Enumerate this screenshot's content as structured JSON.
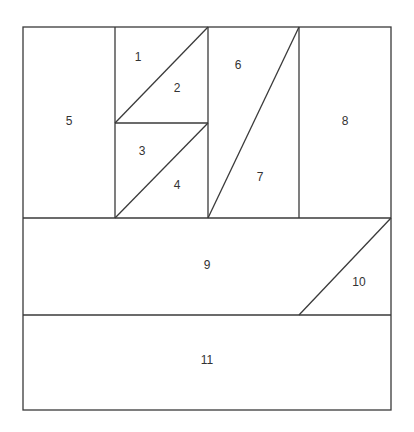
{
  "diagram": {
    "type": "quilt-block-piecing-diagram",
    "line_color": "#3a3a3a",
    "background": "#ffffff",
    "pieces": [
      {
        "id": "1",
        "label": "1",
        "x": 138,
        "y": 58
      },
      {
        "id": "2",
        "label": "2",
        "x": 177,
        "y": 89
      },
      {
        "id": "3",
        "label": "3",
        "x": 142,
        "y": 152
      },
      {
        "id": "4",
        "label": "4",
        "x": 177,
        "y": 186
      },
      {
        "id": "5",
        "label": "5",
        "x": 69,
        "y": 122
      },
      {
        "id": "6",
        "label": "6",
        "x": 238,
        "y": 66
      },
      {
        "id": "7",
        "label": "7",
        "x": 260,
        "y": 178
      },
      {
        "id": "8",
        "label": "8",
        "x": 345,
        "y": 122
      },
      {
        "id": "9",
        "label": "9",
        "x": 207,
        "y": 266
      },
      {
        "id": "10",
        "label": "10",
        "x": 359,
        "y": 283
      },
      {
        "id": "11",
        "label": "11",
        "x": 207,
        "y": 361
      }
    ]
  }
}
